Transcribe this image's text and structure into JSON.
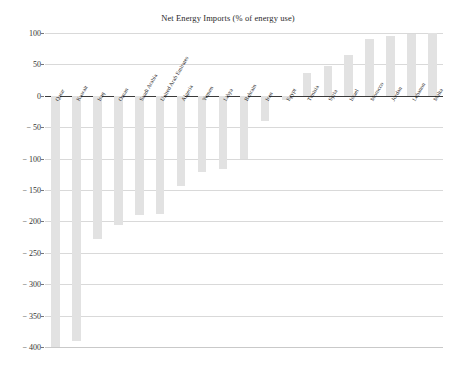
{
  "chart_data": {
    "type": "bar",
    "title": "Net Energy Imports (% of energy use)",
    "xlabel": "",
    "ylabel": "",
    "ylim": [
      -400,
      100
    ],
    "ytick_labels": [
      "100",
      "50",
      "0",
      "− 50",
      "− 100",
      "− 150",
      "− 200",
      "− 250",
      "− 300",
      "− 350",
      "− 400"
    ],
    "ytick_values": [
      100,
      50,
      0,
      -50,
      -100,
      -150,
      -200,
      -250,
      -300,
      -350,
      -400
    ],
    "grid": true,
    "legend": false,
    "orientation": "vertical",
    "bar_color": "#e2e2e2",
    "categories": [
      "Qatar",
      "Kuwait",
      "Iraq",
      "Oman",
      "Saudi Arabia",
      "United Arab Emirates",
      "Algeria",
      "Yemen",
      "Libya",
      "Bahrain",
      "Iran",
      "Egypt",
      "Tunisia",
      "Syria",
      "Israel",
      "Morocco",
      "Jordan",
      "Lebanon",
      "Malta"
    ],
    "values": [
      -400,
      -390,
      -228,
      -205,
      -190,
      -188,
      -143,
      -122,
      -117,
      -101,
      -40,
      -6,
      37,
      48,
      65,
      90,
      96,
      99,
      100
    ]
  },
  "axis": {
    "y_min_label": "− 400",
    "y_max_label": "100"
  }
}
